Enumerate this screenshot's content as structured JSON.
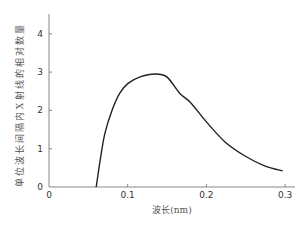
{
  "chart_data": {
    "type": "line",
    "title": "",
    "xlabel": "波长(nm)",
    "ylabel": "单位波长间隔内X射线的相对数量",
    "xlim": [
      0,
      0.31
    ],
    "ylim": [
      0,
      4.5
    ],
    "xticks": [
      "0",
      "0.1",
      "0.2",
      "0.3"
    ],
    "yticks": [
      "0",
      "1",
      "2",
      "3",
      "4"
    ],
    "grid": false,
    "legend": null,
    "series": [
      {
        "name": "X-ray continuous spectrum",
        "x": [
          0.06,
          0.065,
          0.071,
          0.08,
          0.09,
          0.1,
          0.115,
          0.135,
          0.15,
          0.166,
          0.18,
          0.2,
          0.224,
          0.249,
          0.274,
          0.297
        ],
        "y": [
          0.0,
          0.7,
          1.4,
          2.0,
          2.45,
          2.7,
          2.87,
          2.95,
          2.87,
          2.45,
          2.2,
          1.7,
          1.17,
          0.81,
          0.55,
          0.42
        ]
      }
    ]
  }
}
